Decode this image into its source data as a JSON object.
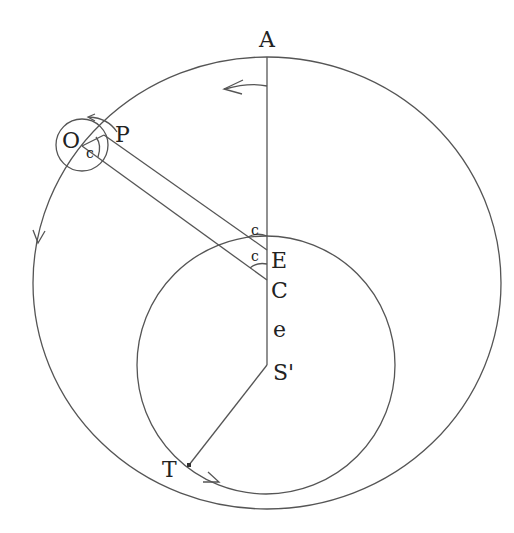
{
  "diagram": {
    "type": "geometric-construction",
    "colors": {
      "stroke": "#555555",
      "text": "#222222",
      "background": "#ffffff"
    },
    "labels": {
      "A": "A",
      "O": "O",
      "P": "P",
      "E": "E",
      "C": "C",
      "e": "e",
      "S": "S'",
      "T": "T",
      "c_small": "c",
      "c_upper": "c",
      "c_lower": "c"
    },
    "shapes": {
      "outer_circle": {
        "cx": 267,
        "cy": 283,
        "rx": 234,
        "ry": 226
      },
      "inner_circle": {
        "cx": 266,
        "cy": 365,
        "r": 129
      },
      "small_circle": {
        "cx": 82,
        "cy": 145,
        "r": 26
      },
      "vertical_line": {
        "x": 267,
        "y1": 57,
        "y2": 365
      },
      "radius_line_ST": {
        "x1": 267,
        "y1": 365,
        "x2": 189,
        "y2": 465
      },
      "strip_upper": {
        "x1": 104,
        "y1": 135,
        "x2": 267,
        "y2": 250
      },
      "strip_lower": {
        "x1": 82,
        "y1": 146,
        "x2": 267,
        "y2": 280
      }
    }
  }
}
